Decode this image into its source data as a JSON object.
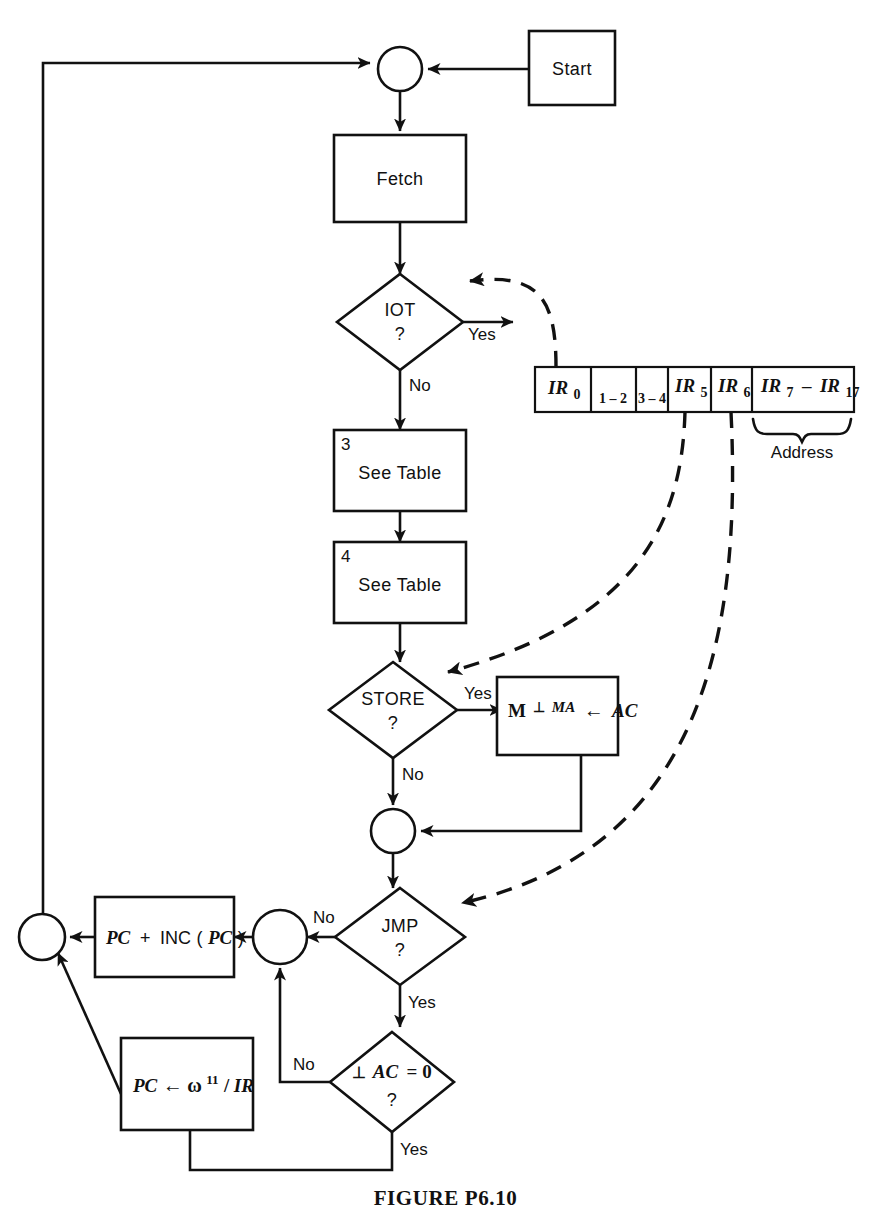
{
  "figure": {
    "caption": "FIGURE  P6.10"
  },
  "nodes": {
    "start": {
      "label": "Start"
    },
    "fetch": {
      "label": "Fetch"
    },
    "iot": {
      "label": "IOT",
      "question": "?"
    },
    "see_table_3": {
      "label": "See Table",
      "corner": "3"
    },
    "see_table_4": {
      "label": "See Table",
      "corner": "4"
    },
    "store": {
      "label": "STORE",
      "question": "?"
    },
    "store_action": {
      "m": "M",
      "perp": "⊥",
      "ma": "MA",
      "arrow": "←",
      "ac": "AC"
    },
    "jmp": {
      "label": "JMP",
      "question": "?"
    },
    "pc_inc": {
      "pc": "PC",
      "plus": "+",
      "inc": "INC",
      "open": "(",
      "pc2": "PC",
      "close": ")"
    },
    "ac_test": {
      "perp": "⊥",
      "ac": "AC",
      "eq": "= 0",
      "question": "?"
    },
    "pc_omega": {
      "pc": "PC",
      "arrow": "←",
      "omega": "ω",
      "exp": "11",
      "slash": "/",
      "ir": "IR"
    }
  },
  "edge_labels": {
    "iot_yes": "Yes",
    "iot_no": "No",
    "store_yes": "Yes",
    "store_no": "No",
    "jmp_no": "No",
    "jmp_yes": "Yes",
    "ac_no": "No",
    "ac_yes": "Yes"
  },
  "register": {
    "title": "Address",
    "cells": [
      {
        "name": "IR",
        "sub": "0",
        "style": "math"
      },
      {
        "name": "1 – 2",
        "sub": "",
        "style": "plain"
      },
      {
        "name": "3 – 4",
        "sub": "",
        "style": "plain"
      },
      {
        "name": "IR",
        "sub": "5",
        "style": "math"
      },
      {
        "name": "IR",
        "sub": "6",
        "style": "math"
      },
      {
        "name": "IR",
        "sub": "7",
        "sub2": "17",
        "dash": "–",
        "style": "math-range"
      }
    ]
  },
  "colors": {
    "ink": "#111111",
    "paper": "#ffffff"
  }
}
